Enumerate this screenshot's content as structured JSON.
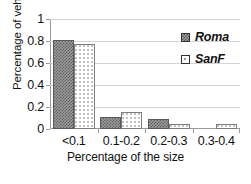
{
  "chart_data": {
    "type": "bar",
    "title": "",
    "xlabel": "Percentage of the size",
    "ylabel": "Percentage of vehchles",
    "categories": [
      "<0.1",
      "0.1-0.2",
      "0.2-0.3",
      "0.3-0.4"
    ],
    "series": [
      {
        "name": "Roma",
        "values": [
          0.81,
          0.105,
          0.095,
          0.0
        ],
        "color": "#8f8f8f",
        "pattern": "checkerboard"
      },
      {
        "name": "SanF",
        "values": [
          0.77,
          0.155,
          0.045,
          0.05
        ],
        "color": "#ffffff",
        "pattern": "dots"
      }
    ],
    "ylim": [
      0,
      1
    ],
    "yticks": [
      "0",
      "0.2",
      "0.4",
      "0.6",
      "0.8",
      "1"
    ],
    "ytick_values": [
      0,
      0.2,
      0.4,
      0.6,
      0.8,
      1
    ],
    "grid": "horizontal",
    "legend_position": "top-right"
  },
  "legend": {
    "items": [
      {
        "label": "Roma"
      },
      {
        "label": "SanF"
      }
    ]
  }
}
